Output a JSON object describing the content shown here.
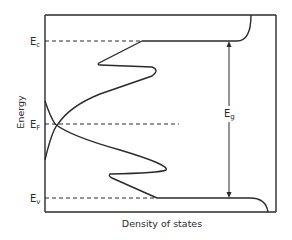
{
  "diagram": {
    "axis_label_y": "Energy",
    "axis_label_x": "Density of states",
    "levels": {
      "conduction": {
        "main": "E",
        "sub": "c"
      },
      "fermi": {
        "main": "E",
        "sub": "F"
      },
      "valence": {
        "main": "E",
        "sub": "v"
      }
    },
    "gap_label": {
      "main": "E",
      "sub": "g"
    },
    "colors": {
      "line": "#2a2a2a",
      "background": "#ffffff"
    }
  }
}
